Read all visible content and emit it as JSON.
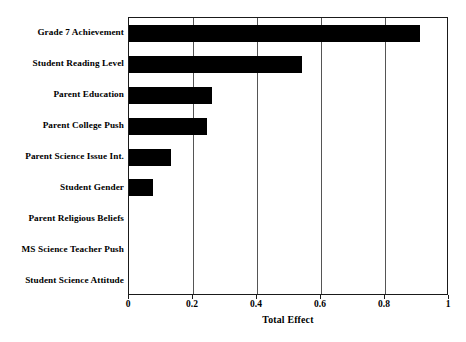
{
  "chart_data": {
    "type": "bar",
    "orientation": "horizontal",
    "title": "",
    "xlabel": "Total Effect",
    "ylabel": "",
    "xlim": [
      0,
      1
    ],
    "ylim": null,
    "grid": "vertical",
    "legend": "none",
    "xticks": [
      "0",
      "0.2",
      "0.4",
      "0.6",
      "0.8",
      "1"
    ],
    "xtick_values": [
      0,
      0.2,
      0.4,
      0.6,
      0.8,
      1
    ],
    "categories": [
      "Grade 7 Achievement",
      "Student Reading Level",
      "Parent Education",
      "Parent College Push",
      "Parent Science Issue Int.",
      "Student Gender",
      "Parent Religious Beliefs",
      "MS Science Teacher Push",
      "Student Science Attitude"
    ],
    "values": [
      0.91,
      0.54,
      0.26,
      0.245,
      0.13,
      0.075,
      0,
      0,
      0
    ],
    "bar_color": "#000000",
    "axis_color": "#1a1a1a",
    "background_color": "#ffffff"
  }
}
